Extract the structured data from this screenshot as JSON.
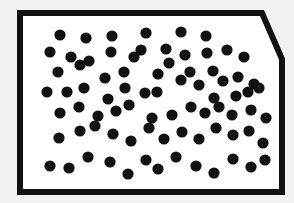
{
  "figure": {
    "title": "Random dot pattern in beveled rectangular frame",
    "canvas": {
      "width": 294,
      "height": 203
    },
    "background_color": "#f2f2f0",
    "interior_color": "#ffffff",
    "ink_color": "#111111",
    "frame": {
      "name": "beveled-rectangle-border",
      "stroke_color": "#111111",
      "stroke_width": 6,
      "outer_points": "20,13 262,13 282,59 282,192 20,192",
      "bevel_description": "top-right corner cut by a diagonal from (262,13) to (282,59)",
      "corners": {
        "top_left": [
          20,
          13
        ],
        "top_right_bevel_start": [
          262,
          13
        ],
        "top_right_bevel_end": [
          282,
          59
        ],
        "bottom_right": [
          282,
          192
        ],
        "bottom_left": [
          20,
          192
        ]
      }
    },
    "dots": {
      "name": "scattered-dot-field",
      "count": 72,
      "fill_color": "#111111",
      "radius": 5.6,
      "points": [
        [
          60,
          35
        ],
        [
          86,
          38
        ],
        [
          112,
          36
        ],
        [
          146,
          33
        ],
        [
          181,
          32
        ],
        [
          206,
          36
        ],
        [
          50,
          52
        ],
        [
          71,
          57
        ],
        [
          89,
          61
        ],
        [
          111,
          52
        ],
        [
          141,
          50
        ],
        [
          166,
          49
        ],
        [
          185,
          55
        ],
        [
          207,
          53
        ],
        [
          227,
          50
        ],
        [
          244,
          57
        ],
        [
          58,
          72
        ],
        [
          80,
          65
        ],
        [
          105,
          78
        ],
        [
          124,
          72
        ],
        [
          134,
          57
        ],
        [
          158,
          74
        ],
        [
          169,
          63
        ],
        [
          190,
          72
        ],
        [
          213,
          71
        ],
        [
          223,
          81
        ],
        [
          238,
          77
        ],
        [
          254,
          84
        ],
        [
          47,
          92
        ],
        [
          67,
          92
        ],
        [
          84,
          88
        ],
        [
          108,
          99
        ],
        [
          125,
          88
        ],
        [
          145,
          93
        ],
        [
          157,
          92
        ],
        [
          181,
          80
        ],
        [
          199,
          85
        ],
        [
          214,
          98
        ],
        [
          236,
          96
        ],
        [
          248,
          92
        ],
        [
          259,
          88
        ],
        [
          60,
          113
        ],
        [
          79,
          107
        ],
        [
          98,
          116
        ],
        [
          116,
          111
        ],
        [
          129,
          105
        ],
        [
          152,
          118
        ],
        [
          172,
          115
        ],
        [
          191,
          107
        ],
        [
          205,
          113
        ],
        [
          219,
          107
        ],
        [
          232,
          115
        ],
        [
          251,
          110
        ],
        [
          266,
          118
        ],
        [
          59,
          138
        ],
        [
          80,
          131
        ],
        [
          95,
          126
        ],
        [
          113,
          134
        ],
        [
          131,
          141
        ],
        [
          149,
          128
        ],
        [
          164,
          139
        ],
        [
          182,
          132
        ],
        [
          199,
          139
        ],
        [
          216,
          128
        ],
        [
          233,
          135
        ],
        [
          249,
          131
        ],
        [
          263,
          143
        ],
        [
          50,
          166
        ],
        [
          69,
          168
        ],
        [
          88,
          157
        ],
        [
          110,
          162
        ],
        [
          128,
          174
        ],
        [
          146,
          160
        ],
        [
          158,
          169
        ],
        [
          176,
          157
        ],
        [
          196,
          166
        ],
        [
          214,
          173
        ],
        [
          233,
          159
        ],
        [
          251,
          167
        ],
        [
          265,
          160
        ]
      ]
    }
  }
}
